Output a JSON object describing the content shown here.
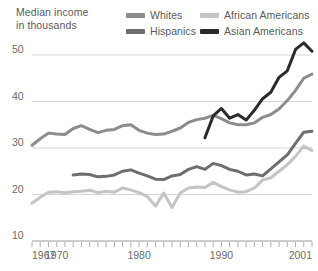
{
  "header": {
    "axis_title": "Median income\nin thousands"
  },
  "legend": {
    "position": "top",
    "entries": [
      {
        "label": "Whites",
        "color": "#8c8c8c",
        "name": "legend-whites"
      },
      {
        "label": "African Americans",
        "color": "#c4c4c4",
        "name": "legend-african-americans"
      },
      {
        "label": "Hispanics",
        "color": "#6e6e6e",
        "name": "legend-hispanics"
      },
      {
        "label": "Asian Americans",
        "color": "#2b2b2b",
        "name": "legend-asian-americans"
      }
    ]
  },
  "chart_data": {
    "type": "line",
    "title": "Median income in thousands",
    "xlabel": "",
    "ylabel": "Median income in thousands",
    "xlim": [
      1967,
      2001
    ],
    "ylim": [
      10,
      53
    ],
    "grid": true,
    "legend_position": "top",
    "ytick_labels": [
      "50",
      "40",
      "30",
      "20",
      "10"
    ],
    "yticks": [
      50,
      40,
      30,
      20,
      10
    ],
    "xtick_labels": [
      "1967",
      "1970",
      "1980",
      "1990",
      "2001"
    ],
    "xticks": [
      1967,
      1970,
      1980,
      1990,
      2001
    ],
    "x_minor_tick_interval": 1,
    "series": [
      {
        "name": "Whites",
        "color": "#8c8c8c",
        "x": [
          1967,
          1968,
          1969,
          1970,
          1971,
          1972,
          1973,
          1974,
          1975,
          1976,
          1977,
          1978,
          1979,
          1980,
          1981,
          1982,
          1983,
          1984,
          1985,
          1986,
          1987,
          1988,
          1989,
          1990,
          1991,
          1992,
          1993,
          1994,
          1995,
          1996,
          1997,
          1998,
          1999,
          2000,
          2001
        ],
        "values": [
          30.6,
          32.0,
          33.2,
          33.0,
          32.9,
          34.2,
          34.8,
          34.0,
          33.3,
          33.8,
          34.0,
          34.8,
          35.0,
          33.8,
          33.2,
          32.9,
          33.0,
          33.6,
          34.3,
          35.5,
          36.1,
          36.4,
          37.0,
          36.3,
          35.4,
          35.0,
          35.0,
          35.4,
          36.6,
          37.2,
          38.4,
          40.2,
          42.4,
          45.0,
          45.9
        ]
      },
      {
        "name": "African Americans",
        "color": "#c4c4c4",
        "x": [
          1967,
          1968,
          1969,
          1970,
          1971,
          1972,
          1973,
          1974,
          1975,
          1976,
          1977,
          1978,
          1979,
          1980,
          1981,
          1982,
          1983,
          1984,
          1985,
          1986,
          1987,
          1988,
          1989,
          1990,
          1991,
          1992,
          1993,
          1994,
          1995,
          1996,
          1997,
          1998,
          1999,
          2000,
          2001
        ],
        "values": [
          18.1,
          19.4,
          20.5,
          20.6,
          20.4,
          20.6,
          20.7,
          20.9,
          20.4,
          20.7,
          20.5,
          21.4,
          21.0,
          20.4,
          19.6,
          17.5,
          20.3,
          17.2,
          20.3,
          21.4,
          21.6,
          21.5,
          22.6,
          21.7,
          21.0,
          20.5,
          20.6,
          21.4,
          23.1,
          23.6,
          25.0,
          26.4,
          28.2,
          30.4,
          29.5
        ]
      },
      {
        "name": "Hispanics",
        "color": "#6e6e6e",
        "x": [
          1972,
          1973,
          1974,
          1975,
          1976,
          1977,
          1978,
          1979,
          1980,
          1981,
          1982,
          1983,
          1984,
          1985,
          1986,
          1987,
          1988,
          1989,
          1990,
          1991,
          1992,
          1993,
          1994,
          1995,
          1996,
          1997,
          1998,
          1999,
          2000,
          2001
        ],
        "values": [
          24.2,
          24.4,
          24.3,
          23.8,
          23.9,
          24.2,
          25.0,
          25.3,
          24.6,
          24.0,
          23.3,
          23.2,
          24.0,
          24.3,
          25.4,
          26.0,
          25.4,
          26.7,
          26.2,
          25.4,
          25.0,
          24.2,
          24.4,
          24.0,
          25.5,
          27.0,
          28.5,
          31.0,
          33.4,
          33.6
        ]
      },
      {
        "name": "Asian Americans",
        "color": "#2b2b2b",
        "x": [
          1988,
          1989,
          1990,
          1991,
          1992,
          1993,
          1994,
          1995,
          1996,
          1997,
          1998,
          1999,
          2000,
          2001
        ],
        "values": [
          32.2,
          36.9,
          38.5,
          36.4,
          37.2,
          36.0,
          38.1,
          40.6,
          42.0,
          45.2,
          46.6,
          51.2,
          52.6,
          50.8
        ]
      }
    ]
  }
}
